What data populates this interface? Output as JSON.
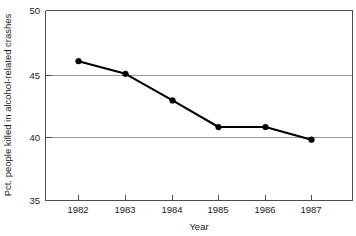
{
  "chart_data": {
    "type": "line",
    "title": "",
    "xlabel": "Year",
    "ylabel": "Pct. people killed in alcohol-related crashes",
    "categories": [
      "1982",
      "1983",
      "1984",
      "1985",
      "1986",
      "1987"
    ],
    "x": [
      1982,
      1983,
      1984,
      1985,
      1986,
      1987
    ],
    "values": [
      46.0,
      45.0,
      42.9,
      40.8,
      40.8,
      39.8
    ],
    "series": [
      {
        "name": "Pct. people killed in alcohol-related crashes",
        "values": [
          46.0,
          45.0,
          42.9,
          40.8,
          40.8,
          39.8
        ]
      }
    ],
    "ylim": [
      35,
      50
    ],
    "yticks": [
      35,
      40,
      45,
      50
    ],
    "ytick_labels": [
      "35",
      "40",
      "45",
      "50"
    ],
    "xtick_labels": [
      "1982",
      "1983",
      "1984",
      "1985",
      "1986",
      "1987"
    ],
    "grid": "horizontal",
    "legend": "none",
    "marker": "filled-circle",
    "line_color": "#000000",
    "grid_color": "#9a9a9a",
    "frame_color": "#4d4d4d",
    "background": "#ffffff"
  },
  "axes": {
    "y_ticks": [
      {
        "label": "50",
        "value": 50
      },
      {
        "label": "45",
        "value": 45
      },
      {
        "label": "40",
        "value": 40
      },
      {
        "label": "35",
        "value": 35
      }
    ],
    "x_ticks": [
      {
        "label": "1982",
        "value": 1982
      },
      {
        "label": "1983",
        "value": 1983
      },
      {
        "label": "1984",
        "value": 1984
      },
      {
        "label": "1985",
        "value": 1985
      },
      {
        "label": "1986",
        "value": 1986
      },
      {
        "label": "1987",
        "value": 1987
      }
    ],
    "x_title": "Year",
    "y_title": "Pct. people killed in alcohol-related crashes"
  }
}
